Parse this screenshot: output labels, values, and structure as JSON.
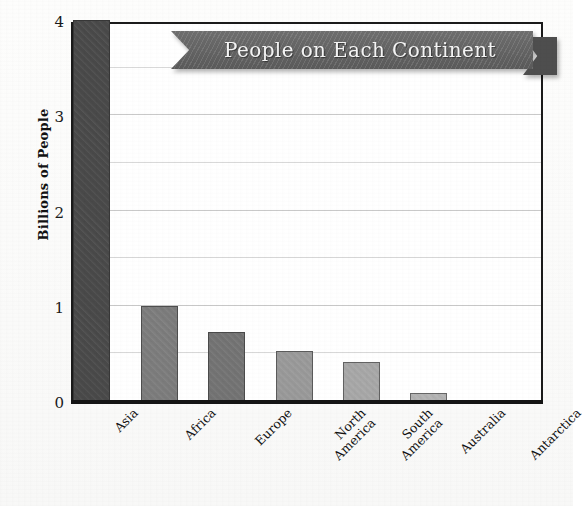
{
  "chart_data": {
    "type": "bar",
    "title": "People on Each Continent",
    "xlabel": "",
    "ylabel": "Billions of People",
    "categories": [
      "Asia",
      "Africa",
      "Europe",
      "North\nAmerica",
      "South\nAmerica",
      "Australia",
      "Antarctica"
    ],
    "values": [
      4.0,
      1.0,
      0.72,
      0.53,
      0.41,
      0.08,
      0.0
    ],
    "ylim": [
      0,
      4
    ],
    "yticks": [
      0,
      1,
      2,
      3,
      4
    ],
    "ytick_labels": [
      "0",
      "1",
      "2",
      "3",
      "4"
    ],
    "gridlines": [
      0.5,
      1.0,
      1.5,
      2.0,
      2.5,
      3.0,
      3.5
    ],
    "grid": true,
    "legend": "none",
    "bar_colors": [
      "#4a4a4a",
      "#7d7d7d",
      "#747474",
      "#9a9a9a",
      "#a8a8a8",
      "#b4b4b4",
      "#c0c0c0"
    ],
    "xtick_rotation": -45
  },
  "style": {
    "title_ribbon_color": "#646464",
    "title_ribbon_tail_color": "#4e4e4e",
    "title_text_color": "#f4f4f4",
    "axis_color": "#1a1a1a",
    "grid_color": "#d8d8d8",
    "page_background": "#fbfbfa"
  }
}
